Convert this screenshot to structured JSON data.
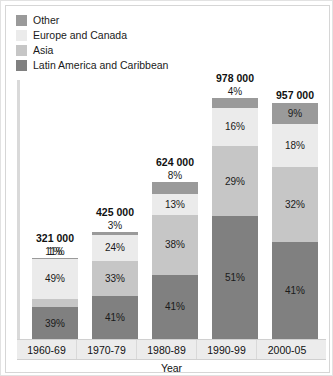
{
  "chart_data": {
    "type": "bar",
    "subtype": "100% stacked bar",
    "title": "",
    "xlabel": "Year",
    "ylabel": "",
    "grid": false,
    "legend_position": "top-left",
    "ylim": [
      0,
      100
    ],
    "categories": [
      "1960-69",
      "1970-79",
      "1980-89",
      "1990-99",
      "2000-05"
    ],
    "totals": [
      "321 000",
      "425 000",
      "624 000",
      "978 000",
      "957 000"
    ],
    "series": [
      {
        "name": "Other",
        "color": "#9a9a9a",
        "values": [
          1,
          3,
          8,
          4,
          9
        ],
        "labels": [
          "1%",
          "3%",
          "8%",
          "4%",
          "9%"
        ]
      },
      {
        "name": "Europe and Canada",
        "color": "#ebebeb",
        "values": [
          49,
          24,
          13,
          16,
          18
        ],
        "labels": [
          "49%",
          "24%",
          "13%",
          "16%",
          "18%"
        ]
      },
      {
        "name": "Asia",
        "color": "#c6c6c6",
        "values": [
          11,
          33,
          38,
          29,
          32
        ],
        "labels": [
          "11%",
          "33%",
          "38%",
          "29%",
          "32%"
        ]
      },
      {
        "name": "Latin America and Caribbean",
        "color": "#808080",
        "values": [
          39,
          41,
          41,
          51,
          41
        ],
        "labels": [
          "39%",
          "41%",
          "41%",
          "51%",
          "41%"
        ]
      }
    ]
  },
  "legend": {
    "items": [
      {
        "label": "Other",
        "color": "#9a9a9a"
      },
      {
        "label": "Europe and Canada",
        "color": "#ebebeb"
      },
      {
        "label": "Asia",
        "color": "#c6c6c6"
      },
      {
        "label": "Latin America and Caribbean",
        "color": "#808080"
      }
    ]
  },
  "axis": {
    "x_title": "Year",
    "x_ticks": [
      "1960-69",
      "1970-79",
      "1980-89",
      "1990-99",
      "2000-05"
    ]
  },
  "bars": [
    {
      "category": "1960-69",
      "total": "321 000",
      "height_pct": 33.5,
      "segments": [
        {
          "name": "Other",
          "label": "1%",
          "pct": 1
        },
        {
          "name": "Europe and Canada",
          "label": "49%",
          "pct": 49
        },
        {
          "name": "Asia",
          "label": "11%",
          "pct": 11
        },
        {
          "name": "Latin America and Caribbean",
          "label": "39%",
          "pct": 39
        }
      ]
    },
    {
      "category": "1970-79",
      "total": "425 000",
      "height_pct": 44.4,
      "segments": [
        {
          "name": "Other",
          "label": "3%",
          "pct": 3
        },
        {
          "name": "Europe and Canada",
          "label": "24%",
          "pct": 24
        },
        {
          "name": "Asia",
          "label": "33%",
          "pct": 33
        },
        {
          "name": "Latin America and Caribbean",
          "label": "41%",
          "pct": 41
        }
      ]
    },
    {
      "category": "1980-89",
      "total": "624 000",
      "height_pct": 65.2,
      "segments": [
        {
          "name": "Other",
          "label": "8%",
          "pct": 8
        },
        {
          "name": "Europe and Canada",
          "label": "13%",
          "pct": 13
        },
        {
          "name": "Asia",
          "label": "38%",
          "pct": 38
        },
        {
          "name": "Latin America and Caribbean",
          "label": "41%",
          "pct": 41
        }
      ]
    },
    {
      "category": "1990-99",
      "total": "978 000",
      "height_pct": 100,
      "segments": [
        {
          "name": "Other",
          "label": "4%",
          "pct": 4
        },
        {
          "name": "Europe and Canada",
          "label": "16%",
          "pct": 16
        },
        {
          "name": "Asia",
          "label": "29%",
          "pct": 29
        },
        {
          "name": "Latin America and Caribbean",
          "label": "51%",
          "pct": 51
        }
      ]
    },
    {
      "category": "2000-05",
      "total": "957 000",
      "height_pct": 97.9,
      "segments": [
        {
          "name": "Other",
          "label": "9%",
          "pct": 9
        },
        {
          "name": "Europe and Canada",
          "label": "18%",
          "pct": 18
        },
        {
          "name": "Asia",
          "label": "32%",
          "pct": 32
        },
        {
          "name": "Latin America and Caribbean",
          "label": "41%",
          "pct": 41
        }
      ]
    }
  ]
}
